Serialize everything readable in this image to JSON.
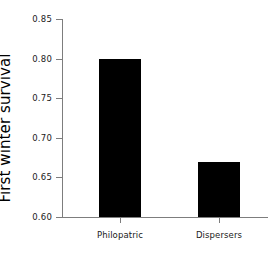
{
  "chart_data": {
    "type": "bar",
    "title": "",
    "xlabel": "",
    "ylabel": "First winter survival",
    "categories": [
      "Philopatric",
      "Dispersers"
    ],
    "values": [
      0.8,
      0.67
    ],
    "ylim": [
      0.6,
      0.85
    ],
    "yticks": [
      0.6,
      0.65,
      0.7,
      0.75,
      0.8,
      0.85
    ],
    "ytick_labels": [
      "0.60",
      "0.65",
      "0.70",
      "0.75",
      "0.80",
      "0.85"
    ],
    "grid": false,
    "legend": null,
    "bar_color": "#000000",
    "axis_color": "#7d7d7d",
    "text_color": "#1a1a1a"
  }
}
